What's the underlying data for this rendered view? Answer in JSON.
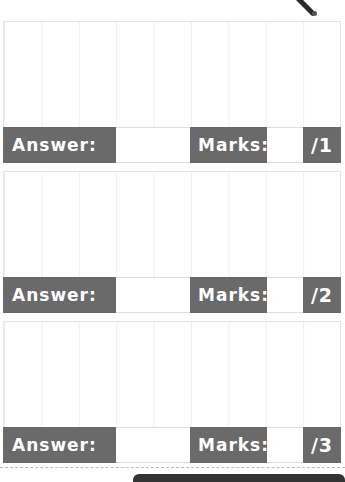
{
  "questions": [
    {
      "answer_label": "Answer:",
      "answer_value": "",
      "marks_label": "Marks:",
      "marks_value": "",
      "marks_total": "/1"
    },
    {
      "answer_label": "Answer:",
      "answer_value": "",
      "marks_label": "Marks:",
      "marks_value": "",
      "marks_total": "/2"
    },
    {
      "answer_label": "Answer:",
      "answer_value": "",
      "marks_label": "Marks:",
      "marks_value": "",
      "marks_total": "/3"
    }
  ],
  "colors": {
    "bar": "#6a6a6a",
    "grid": "#efefef"
  }
}
